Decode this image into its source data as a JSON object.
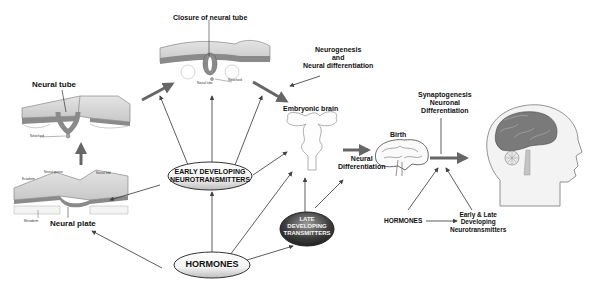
{
  "diagram": {
    "type": "neurodevelopment-flow",
    "stages": {
      "neural_plate": "Neural plate",
      "neural_tube": "Neural tube",
      "closure": "Closure of neural tube",
      "embryonic_brain": "Embryonic brain",
      "birth": "Birth"
    },
    "processes": {
      "neurogenesis_line1": "Neurogenesis",
      "neurogenesis_line2": "and",
      "neurogenesis_line3": "Neural differentiation",
      "neural_diff_line1": "Neural",
      "neural_diff_line2": "Differentiation",
      "synapto_line1": "Synaptogenesis",
      "synapto_line2": "Neuronal",
      "synapto_line3": "Differentiation"
    },
    "nodes": {
      "early_line1": "EARLY DEVELOPING",
      "early_line2": "NEUROTRANSMITTERS",
      "late_line1": "LATE",
      "late_line2": "DEVELOPING",
      "late_line3": "TRANSMITTERS",
      "hormones": "HORMONES",
      "hormones_right": "HORMONES",
      "early_late_line1": "Early & Late",
      "early_late_line2": "Developing",
      "early_late_line3": "Neurotransmitters"
    },
    "tiny_labels": {
      "notochord": "Notochord",
      "neural_tube_small": "Neural tube",
      "notochord_small": "Notochord",
      "ectoderm": "Ectoderm",
      "neural_groove": "Neural groove",
      "neural_fold": "Neural fold",
      "mesoderm": "Mesoderm"
    },
    "colors": {
      "arrow": "#555555",
      "thick_arrow": "#666666",
      "tissue_dark": "#8a8a8a",
      "tissue_light": "#d9d9d9",
      "late_ellipse": "#3a3a3a",
      "brain": "#7a7a7a"
    }
  }
}
